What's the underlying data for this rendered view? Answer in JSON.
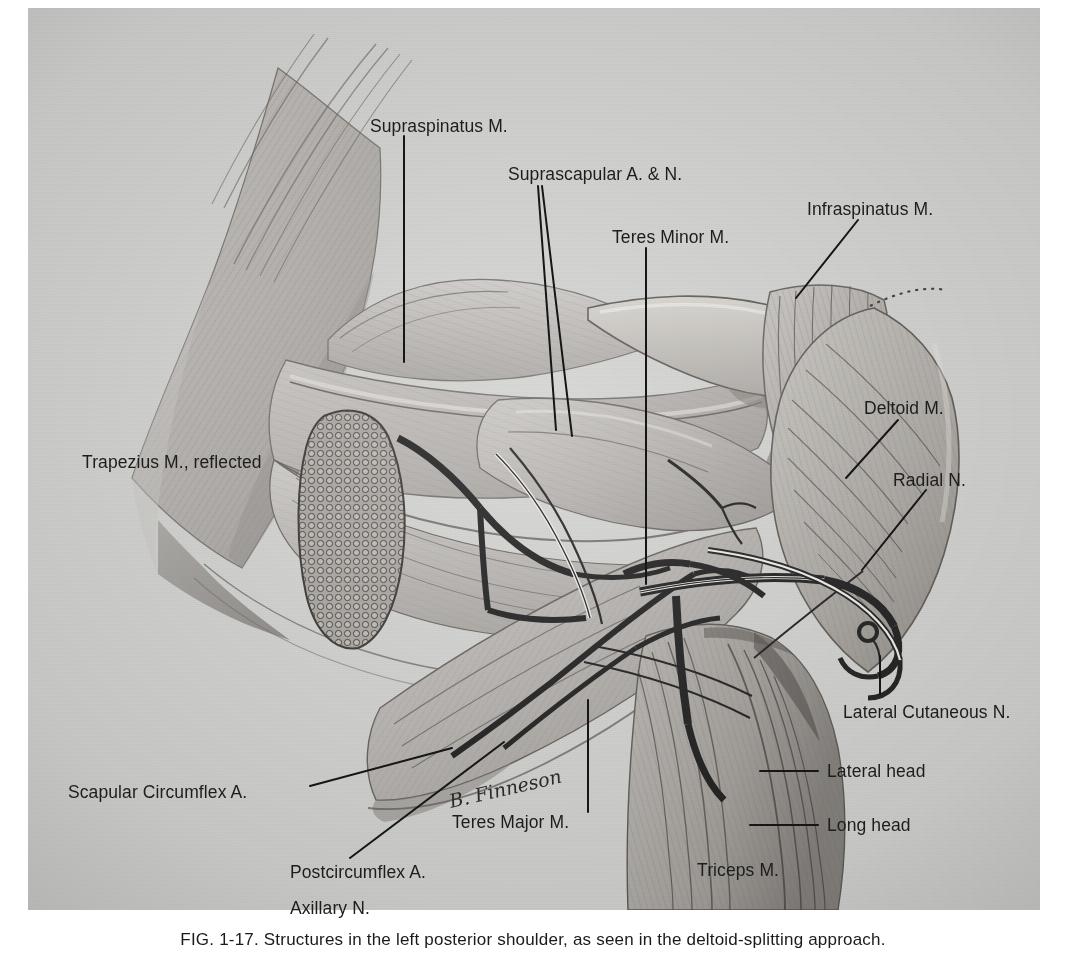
{
  "figure": {
    "kind": "anatomical-illustration",
    "background_color": "#d2d2d0",
    "ink_color": "#1d1d1d",
    "signature": "B. Finneson"
  },
  "caption": {
    "figure_number": "FIG. 1-17.",
    "text": "Structures in the left posterior shoulder, as seen in the deltoid-splitting approach."
  },
  "labels": [
    {
      "id": "supraspinatus",
      "text": "Supraspinatus M.",
      "x": 370,
      "y": 116
    },
    {
      "id": "suprascapular",
      "text": "Suprascapular A. & N.",
      "x": 508,
      "y": 164
    },
    {
      "id": "teres-minor",
      "text": "Teres Minor M.",
      "x": 612,
      "y": 227
    },
    {
      "id": "infraspinatus",
      "text": "Infraspinatus M.",
      "x": 807,
      "y": 199
    },
    {
      "id": "deltoid",
      "text": "Deltoid M.",
      "x": 864,
      "y": 398
    },
    {
      "id": "radial",
      "text": "Radial N.",
      "x": 893,
      "y": 470
    },
    {
      "id": "lateral-cutaneous",
      "text": "Lateral Cutaneous N.",
      "x": 843,
      "y": 702
    },
    {
      "id": "lateral-head",
      "text": "Lateral head",
      "x": 827,
      "y": 768
    },
    {
      "id": "long-head",
      "text": "Long head",
      "x": 827,
      "y": 822
    },
    {
      "id": "triceps",
      "text": "Triceps M.",
      "x": 697,
      "y": 870
    },
    {
      "id": "trapezius",
      "text": "Trapezius M., reflected",
      "x": 82,
      "y": 462
    },
    {
      "id": "scapular-circumflex",
      "text": "Scapular Circumflex A.",
      "x": 68,
      "y": 792
    },
    {
      "id": "postcircumflex",
      "text": "Postcircumflex A.",
      "x": 290,
      "y": 870
    },
    {
      "id": "axillary",
      "text": "Axillary N.",
      "x": 290,
      "y": 905
    },
    {
      "id": "teres-major",
      "text": "Teres Major M.",
      "x": 452,
      "y": 820
    }
  ],
  "leaders": [
    {
      "id": "supraspinatus-leader",
      "points": "376,132 376,356"
    },
    {
      "id": "suprascapular-leader-a",
      "points": "546,180 565,428"
    },
    {
      "id": "suprascapular-leader-b",
      "points": "549,180 578,432"
    },
    {
      "id": "teres-minor-leader",
      "points": "616,243 616,578"
    },
    {
      "id": "infraspinatus-leader",
      "points": "828,215 768,292"
    },
    {
      "id": "deltoid-leader",
      "points": "868,414 817,470"
    },
    {
      "id": "radial-leader",
      "points": "897,486 835,563"
    },
    {
      "id": "lateral-cutaneous-leader",
      "points": "852,690 852,656"
    },
    {
      "id": "lateral-head-leader",
      "points": "822,763 770,763"
    },
    {
      "id": "long-head-leader",
      "points": "822,817 762,817"
    },
    {
      "id": "trapezius-leader",
      "points": "0,0 0,0"
    },
    {
      "id": "scapular-circumflex-leader",
      "points": "283,785 424,748"
    },
    {
      "id": "postcircumflex-leader",
      "points": "327,856 476,740"
    },
    {
      "id": "teres-major-leader",
      "points": "561,812 561,700"
    }
  ],
  "signature_position": {
    "x": 424,
    "y": 800
  },
  "anatomy_regions": [
    {
      "name": "trapezius-muscle-reflected"
    },
    {
      "name": "supraspinatus-muscle"
    },
    {
      "name": "scapular-spine"
    },
    {
      "name": "infraspinatus-muscle"
    },
    {
      "name": "teres-minor-muscle"
    },
    {
      "name": "teres-major-muscle"
    },
    {
      "name": "deltoid-muscle"
    },
    {
      "name": "triceps-lateral-head"
    },
    {
      "name": "triceps-long-head"
    },
    {
      "name": "suprascapular-vessels-and-nerve"
    },
    {
      "name": "scapular-circumflex-artery"
    },
    {
      "name": "postcircumflex-artery-and-axillary-nerve"
    },
    {
      "name": "radial-nerve"
    },
    {
      "name": "lateral-cutaneous-nerve"
    },
    {
      "name": "adipose-fat-pad"
    }
  ]
}
